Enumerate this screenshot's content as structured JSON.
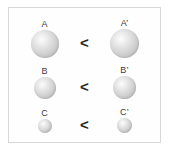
{
  "figure": {
    "background_color": "#ffffff",
    "frame_border_color": "#d8d8d8",
    "sphere_fill_color": "#cfcfcf",
    "sphere_highlight_color": "#fcfcfc",
    "label_color": "#3b3b3b",
    "operator_color": "#262626"
  },
  "rows": [
    {
      "left": {
        "label": "A",
        "size": "large"
      },
      "operator": "<",
      "right": {
        "label": "A’",
        "size": "large"
      }
    },
    {
      "left": {
        "label": "B",
        "size": "medium"
      },
      "operator": "<",
      "right": {
        "label": "B’",
        "size": "medium"
      }
    },
    {
      "left": {
        "label": "C",
        "size": "small"
      },
      "operator": "<",
      "right": {
        "label": "C’",
        "size": "small"
      }
    }
  ]
}
